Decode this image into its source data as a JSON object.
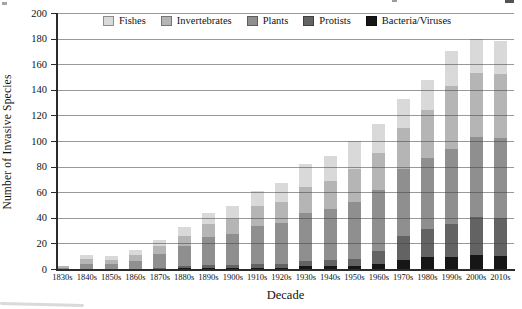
{
  "axis": {
    "ylabel": "Number of Invasive Species",
    "xlabel": "Decade"
  },
  "chart_data": {
    "type": "bar",
    "stacked": true,
    "xlabel": "Decade",
    "ylabel": "Number of Invasive Species",
    "ylim": [
      0,
      200
    ],
    "ytick_step": 20,
    "ytick_labels": [
      "0",
      "20",
      "40",
      "60",
      "80",
      "100",
      "120",
      "140",
      "160",
      "180",
      "200"
    ],
    "grid": true,
    "legend_position": "top",
    "legend_order": [
      "Fishes",
      "Invertebrates",
      "Plants",
      "Protists",
      "Bacteria/Viruses"
    ],
    "categories": [
      "1830s",
      "1840s",
      "1850s",
      "1860s",
      "1870s",
      "1880s",
      "1890s",
      "1900s",
      "1910s",
      "1920s",
      "1930s",
      "1940s",
      "1950s",
      "1960s",
      "1970s",
      "1980s",
      "1990s",
      "2000s",
      "2010s"
    ],
    "series": [
      {
        "name": "Bacteria/Viruses",
        "color": "#161616",
        "values": [
          0,
          0,
          0,
          0,
          0,
          1,
          1,
          1,
          1,
          1,
          2,
          2,
          2,
          4,
          7,
          9,
          9,
          11,
          10
        ]
      },
      {
        "name": "Protists",
        "color": "#636363",
        "values": [
          0,
          0,
          0,
          0,
          1,
          1,
          2,
          2,
          3,
          3,
          4,
          5,
          6,
          10,
          19,
          22,
          26,
          30,
          30
        ]
      },
      {
        "name": "Plants",
        "color": "#8f8f8f",
        "values": [
          1,
          4,
          4,
          6,
          11,
          16,
          22,
          24,
          30,
          32,
          38,
          40,
          44,
          48,
          52,
          56,
          59,
          62,
          62
        ]
      },
      {
        "name": "Invertebrates",
        "color": "#b5b5b5",
        "values": [
          1,
          4,
          3,
          5,
          6,
          8,
          10,
          12,
          15,
          16,
          20,
          22,
          26,
          29,
          32,
          37,
          49,
          50,
          50
        ]
      },
      {
        "name": "Fishes",
        "color": "#d9d9d9",
        "values": [
          0,
          3,
          3,
          4,
          5,
          7,
          9,
          10,
          12,
          15,
          18,
          19,
          22,
          22,
          23,
          24,
          27,
          27,
          26
        ]
      }
    ],
    "totals": [
      2,
      11,
      10,
      15,
      23,
      33,
      44,
      49,
      61,
      67,
      82,
      88,
      100,
      113,
      133,
      148,
      170,
      180,
      178
    ]
  }
}
